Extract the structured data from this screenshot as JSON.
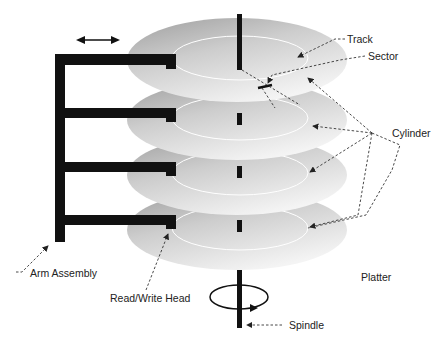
{
  "diagram": {
    "type": "hard-disk-drive-anatomy",
    "platter_count": 4,
    "labels": {
      "track": "Track",
      "sector": "Sector",
      "cylinder": "Cylinder",
      "arm_assembly": "Arm Assembly",
      "read_write_head": "Read/Write Head",
      "platter": "Platter",
      "spindle": "Spindle"
    },
    "icons": {
      "arm_motion": "double-headed-arrow",
      "spindle_rotation": "circular-rotation-arrow"
    },
    "colors": {
      "platter_light": "#f0f0f0",
      "platter_dark": "#a8a8a8",
      "mechanism": "#111111",
      "leader_line": "#333333",
      "track_ring": "#ffffff"
    }
  }
}
